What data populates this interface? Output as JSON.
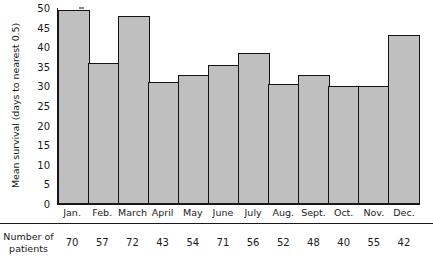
{
  "chart_data": {
    "type": "bar",
    "title": "",
    "xlabel": "",
    "ylabel": "Mean survival (days to nearest 0.5)",
    "ylim": [
      0,
      50
    ],
    "yticks": [
      0,
      5,
      10,
      15,
      20,
      25,
      30,
      35,
      40,
      45,
      50
    ],
    "grid": false,
    "legend": "none",
    "categories": [
      "Jan.",
      "Feb.",
      "March",
      "April",
      "May",
      "June",
      "July",
      "Aug.",
      "Sept.",
      "Oct.",
      "Nov.",
      "Dec."
    ],
    "values": [
      49.5,
      36.0,
      48.0,
      31.0,
      33.0,
      35.5,
      38.5,
      30.5,
      33.0,
      30.0,
      30.0,
      43.0
    ],
    "annotations": {
      "row_label_line1": "Number of",
      "row_label_line2": "patients",
      "row_values": [
        70,
        57,
        72,
        43,
        54,
        71,
        56,
        52,
        48,
        40,
        55,
        42
      ]
    },
    "colors": {
      "bar_fill": "#bfbfbf",
      "bar_edge": "#141414",
      "axis": "#1a1a1a",
      "text": "#1a1a1a",
      "background": "#ffffff"
    }
  }
}
